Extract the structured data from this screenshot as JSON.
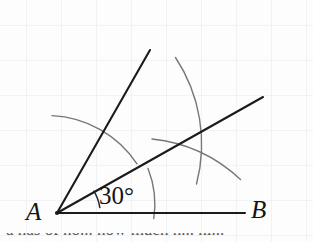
{
  "figure": {
    "labels": {
      "vertex": "A",
      "ray_end": "B",
      "angle_measure": "30°"
    },
    "bottom_cut_text": "a has of no... how much h... hi...",
    "colors": {
      "paper": "#fdfdfd",
      "grid": "#e4eaf0",
      "ink": "#1b1b1b",
      "arc_ink": "#6e6e6e",
      "label": "#141414"
    },
    "grid": {
      "spacing_px": 35,
      "x_offset": 26,
      "y_offset": 25,
      "visible": true
    },
    "points": {
      "A": [
        57,
        213
      ],
      "B_end": [
        245,
        213
      ],
      "middle_ray_end": [
        263,
        97
      ],
      "upper_ray_end": [
        150,
        50
      ],
      "arc_intersection": [
        203,
        148
      ]
    },
    "angles": {
      "horizontal_ray_deg": 0,
      "middle_ray_deg": 30,
      "upper_ray_deg": 60
    },
    "arcs": [
      {
        "name": "angle-marker-arc",
        "radius": 42,
        "start_deg": 0,
        "end_deg": 30
      },
      {
        "name": "large-construction-arc",
        "radius": 97,
        "start_deg": -4,
        "end_deg": 28
      },
      {
        "name": "left-construction-arc",
        "radius": 108,
        "start_deg": 46,
        "end_deg": 96
      },
      {
        "name": "upper-bisector-arc",
        "radius": 157,
        "start_deg": 20,
        "end_deg": 62
      },
      {
        "name": "lower-bisector-arc",
        "radius": 152,
        "start_deg": 4,
        "end_deg": 50
      }
    ]
  }
}
